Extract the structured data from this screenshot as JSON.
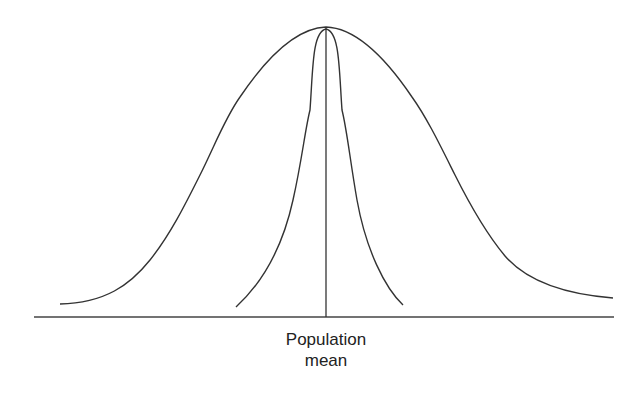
{
  "diagram": {
    "title": "",
    "axis_label": {
      "line1": "Population",
      "line2": "mean"
    },
    "curves": [
      {
        "name": "wide-distribution",
        "shape": "wide bell curve"
      },
      {
        "name": "narrow-distribution",
        "shape": "narrow peaked curve"
      }
    ],
    "colors": {
      "line": "#333333",
      "background": "#ffffff",
      "text": "#222222"
    }
  }
}
